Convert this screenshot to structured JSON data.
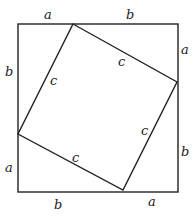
{
  "diagram": {
    "outer_square": {
      "x1": 18,
      "y1": 24,
      "x2": 178,
      "y2": 192
    },
    "inner_square": {
      "points": "73,24 177,82 123,190 18,134"
    },
    "stroke_color": "#222222",
    "labels": {
      "top_a": "a",
      "top_b": "b",
      "right_a": "a",
      "right_b": "b",
      "bottom_b": "b",
      "bottom_a": "a",
      "left_b": "b",
      "left_a": "a",
      "c_top_left": "c",
      "c_top_right": "c",
      "c_bottom_right": "c",
      "c_bottom_left": "c"
    }
  }
}
